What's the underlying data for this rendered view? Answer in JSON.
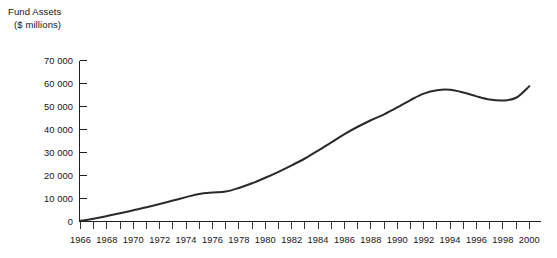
{
  "chart_data": {
    "type": "line",
    "title": "Fund Assets",
    "subtitle": "($ millions)",
    "xlabel": "",
    "ylabel": "",
    "ylim": [
      0,
      70000
    ],
    "xlim": [
      1965,
      2001
    ],
    "grid": false,
    "legend": null,
    "y_ticks": [
      0,
      10000,
      20000,
      30000,
      40000,
      50000,
      60000,
      70000
    ],
    "y_tick_labels": [
      "0",
      "10 000",
      "20 000",
      "30 000",
      "40 000",
      "50 000",
      "60 000",
      "70 000"
    ],
    "x_ticks": [
      1966,
      1968,
      1970,
      1972,
      1974,
      1976,
      1978,
      1980,
      1982,
      1984,
      1986,
      1988,
      1990,
      1992,
      1994,
      1996,
      1998,
      2000
    ],
    "x_tick_labels": [
      "1966",
      "1968",
      "1970",
      "1972",
      "1974",
      "1976",
      "1978",
      "1980",
      "1982",
      "1984",
      "1986",
      "1988",
      "1990",
      "1992",
      "1994",
      "1996",
      "1998",
      "2000"
    ],
    "x_minor_tick_interval": 1,
    "series_name": "Fund Assets",
    "line_color": "#2a2a2a",
    "x": [
      1966,
      1967,
      1968,
      1969,
      1970,
      1971,
      1972,
      1973,
      1974,
      1975,
      1976,
      1977,
      1978,
      1979,
      1980,
      1981,
      1982,
      1983,
      1984,
      1985,
      1986,
      1987,
      1988,
      1989,
      1990,
      1991,
      1992,
      1993,
      1994,
      1995,
      1996,
      1997,
      1998,
      1999,
      2000
    ],
    "values": [
      300,
      1200,
      2400,
      3600,
      4900,
      6200,
      7600,
      9100,
      10600,
      12000,
      12600,
      13000,
      14600,
      16600,
      19000,
      21600,
      24400,
      27400,
      30800,
      34400,
      38000,
      41200,
      44000,
      46600,
      49600,
      52800,
      55600,
      57100,
      57300,
      56100,
      54400,
      53000,
      52600,
      53800,
      58800
    ]
  }
}
